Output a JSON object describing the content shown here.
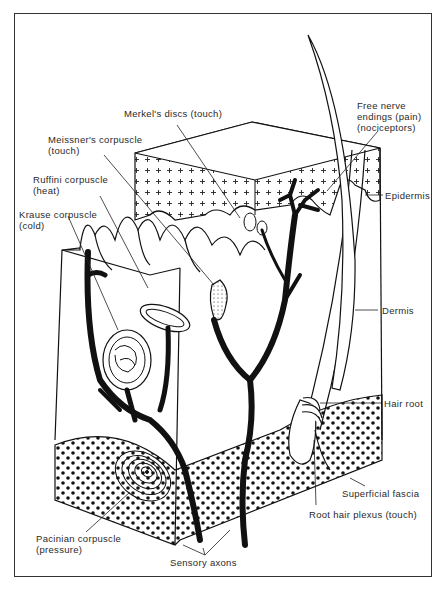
{
  "diagram": {
    "labels": {
      "merkel": {
        "line1": "Merkel's discs (touch)"
      },
      "free_nerve": {
        "line1": "Free nerve",
        "line2": "endings (pain)",
        "line3": "(nociceptors)"
      },
      "meissner": {
        "line1": "Meissner's corpuscle",
        "line2": "(touch)"
      },
      "ruffini": {
        "line1": "Ruffini corpuscle",
        "line2": "(heat)"
      },
      "krause": {
        "line1": "Krause corpuscle",
        "line2": "(cold)"
      },
      "epidermis": {
        "line1": "Epidermis"
      },
      "dermis": {
        "line1": "Dermis"
      },
      "hair_root": {
        "line1": "Hair root"
      },
      "superficial_fascia": {
        "line1": "Superficial fascia"
      },
      "root_hair_plexus": {
        "line1": "Root hair plexus (touch)"
      },
      "pacinian": {
        "line1": "Pacinian corpuscle",
        "line2": "(pressure)"
      },
      "sensory_axons": {
        "line1": "Sensory axons"
      }
    },
    "colors": {
      "ink": "#111111",
      "paper": "#ffffff",
      "text": "#2a2a2a"
    }
  }
}
